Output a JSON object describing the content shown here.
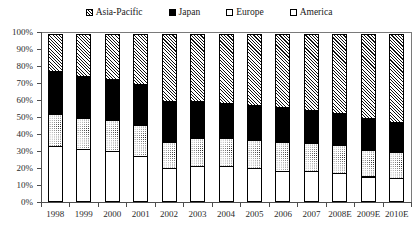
{
  "chart_data": {
    "type": "bar",
    "subtype": "100% stacked column",
    "title": "",
    "xlabel": "",
    "ylabel": "",
    "ylim": [
      0,
      100
    ],
    "ytick_labels": [
      "100%",
      "90%",
      "80%",
      "70%",
      "60%",
      "50%",
      "40%",
      "30%",
      "20%",
      "10%",
      "0%"
    ],
    "ytick_values": [
      100,
      90,
      80,
      70,
      60,
      50,
      40,
      30,
      20,
      10,
      0
    ],
    "grid": false,
    "legend_position": "top",
    "stack_order_bottom_to_top": [
      "America",
      "Europe",
      "Japan",
      "Asia-Pacific"
    ],
    "categories": [
      "1998",
      "1999",
      "2000",
      "2001",
      "2002",
      "2003",
      "2004",
      "2005",
      "2006",
      "2007",
      "2008E",
      "2009E",
      "2010E"
    ],
    "series": [
      {
        "name": "America",
        "fill": "white",
        "values": [
          33,
          31,
          30,
          27,
          20,
          21,
          21,
          20,
          18,
          18,
          17,
          15,
          14
        ]
      },
      {
        "name": "Europe",
        "fill": "dotted",
        "values": [
          19,
          19,
          19,
          19,
          16,
          17,
          17,
          17,
          18,
          17,
          17,
          16,
          16
        ]
      },
      {
        "name": "Japan",
        "fill": "solid-black",
        "values": [
          26,
          25,
          24,
          24,
          24,
          22,
          21,
          21,
          21,
          20,
          19,
          19,
          18
        ]
      },
      {
        "name": "Asia-Pacific",
        "fill": "hatched",
        "values": [
          22,
          25,
          27,
          30,
          40,
          40,
          41,
          42,
          43,
          45,
          47,
          50,
          52
        ]
      }
    ]
  },
  "legend": {
    "items": [
      {
        "label": "Asia-Pacific",
        "swatch": "hatched-swatch-icon"
      },
      {
        "label": "Japan",
        "swatch": "solid-black-swatch-icon"
      },
      {
        "label": "Europe",
        "swatch": "dotted-swatch-icon"
      },
      {
        "label": "America",
        "swatch": "white-swatch-icon"
      }
    ]
  },
  "colors": {
    "axis": "#4d4d4d",
    "text": "#2b2b2b",
    "japan": "#000000",
    "background": "#ffffff"
  }
}
